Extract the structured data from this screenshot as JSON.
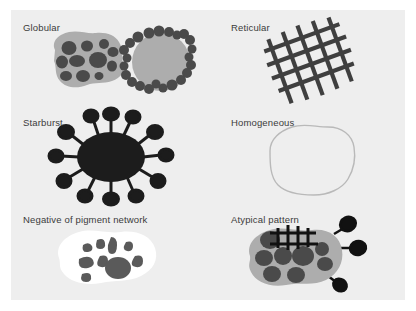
{
  "figure": {
    "background_color": "#eeeeee",
    "page_color": "#ffffff",
    "label_color": "#3b3b3b"
  },
  "palette": {
    "blob_gray": "#adadad",
    "dot_dark": "#4a4a4a",
    "near_black": "#1c1c1c",
    "white_blob": "#ffffff",
    "outline_gray": "#b9b9b9",
    "fragment_gray": "#5a5a5a"
  },
  "panels": [
    {
      "id": "globular",
      "label": "Globular",
      "description": "Amorphous gray blob filled with dark globules, beside a gray disc ringed by dark globules"
    },
    {
      "id": "reticular",
      "label": "Reticular",
      "description": "Tilted dark lattice of crossing lines forming a net"
    },
    {
      "id": "starburst",
      "label": "Starburst",
      "description": "Near-black oval body with radiating club-shaped pseudopods"
    },
    {
      "id": "homogeneous",
      "label": "Homogeneous",
      "description": "Thin gray outlined blob with no internal structure"
    },
    {
      "id": "negative-pigment-network",
      "label": "Negative of pigment network",
      "description": "White blob containing irregular dark gray fragments"
    },
    {
      "id": "atypical-pattern",
      "label": "Atypical pattern",
      "description": "Gray blob with dark globules, an overlaid black grid and dark peripheral projections"
    }
  ]
}
